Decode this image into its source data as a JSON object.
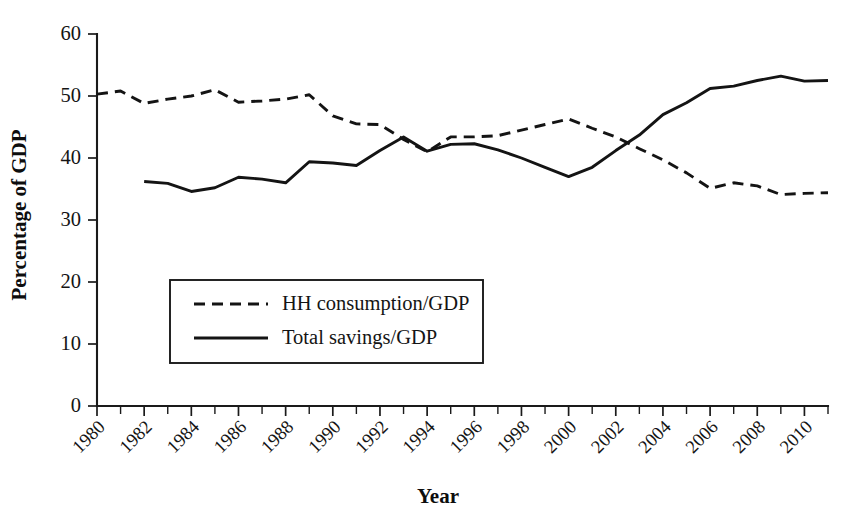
{
  "chart_data": {
    "type": "line",
    "title": "",
    "xlabel": "Year",
    "ylabel": "Percentage of GDP",
    "xlim": [
      1980,
      2011
    ],
    "ylim": [
      0,
      60
    ],
    "ytick_values": [
      0,
      10,
      20,
      30,
      40,
      50,
      60
    ],
    "ytick_labels": [
      "0",
      "10",
      "20",
      "30",
      "40",
      "50",
      "60"
    ],
    "xtick_values": [
      1980,
      1982,
      1984,
      1986,
      1988,
      1990,
      1992,
      1994,
      1996,
      1998,
      2000,
      2002,
      2004,
      2006,
      2008,
      2010
    ],
    "xtick_labels": [
      "1980",
      "1982",
      "1984",
      "1986",
      "1988",
      "1990",
      "1992",
      "1994",
      "1996",
      "1998",
      "2000",
      "2002",
      "2004",
      "2006",
      "2008",
      "2010"
    ],
    "xtick_minor_step": 1,
    "xtick_label_rotation": -45,
    "grid": false,
    "legend_position": "lower-left-inside",
    "series": [
      {
        "name": "HH consumption/GDP",
        "style": "dashed",
        "color": "#141414",
        "x": [
          1980,
          1981,
          1982,
          1983,
          1984,
          1985,
          1986,
          1987,
          1988,
          1989,
          1990,
          1991,
          1992,
          1993,
          1994,
          1995,
          1996,
          1997,
          1998,
          1999,
          2000,
          2001,
          2002,
          2003,
          2004,
          2005,
          2006,
          2007,
          2008,
          2009,
          2010,
          2011
        ],
        "values": [
          50.3,
          50.8,
          48.8,
          49.5,
          50.0,
          51.0,
          49.0,
          49.2,
          49.5,
          50.2,
          46.8,
          45.5,
          45.4,
          43.0,
          41.0,
          43.4,
          43.4,
          43.6,
          44.5,
          45.4,
          46.3,
          44.8,
          43.4,
          41.5,
          39.7,
          37.6,
          35.1,
          36.0,
          35.5,
          34.1,
          34.3,
          34.4
        ]
      },
      {
        "name": "Total savings/GDP",
        "style": "solid",
        "color": "#141414",
        "x": [
          1982,
          1983,
          1984,
          1985,
          1986,
          1987,
          1988,
          1989,
          1990,
          1991,
          1992,
          1993,
          1994,
          1995,
          1996,
          1997,
          1998,
          1999,
          2000,
          2001,
          2002,
          2003,
          2004,
          2005,
          2006,
          2007,
          2008,
          2009,
          2010,
          2011
        ],
        "values": [
          36.2,
          35.9,
          34.6,
          35.2,
          36.9,
          36.6,
          36.0,
          39.4,
          39.2,
          38.8,
          41.2,
          43.4,
          41.1,
          42.2,
          42.3,
          41.3,
          40.0,
          38.5,
          37.0,
          38.5,
          41.2,
          43.7,
          47.0,
          48.9,
          51.2,
          51.6,
          52.5,
          53.2,
          52.4,
          52.5
        ]
      }
    ]
  },
  "legend": {
    "entries": [
      {
        "label": "HH consumption/GDP",
        "style": "dashed"
      },
      {
        "label": "Total savings/GDP",
        "style": "solid"
      }
    ]
  },
  "colors": {
    "ink": "#141414",
    "background": "#ffffff"
  }
}
